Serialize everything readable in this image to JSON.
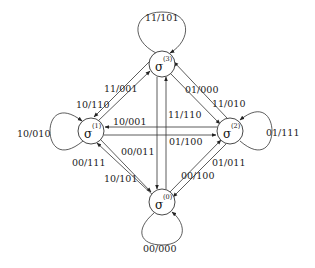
{
  "diagram": {
    "type": "state-transition-diagram",
    "states": [
      {
        "id": "s3",
        "symbol": "σ",
        "index": "(3)",
        "position": "top"
      },
      {
        "id": "s1",
        "symbol": "σ",
        "index": "(1)",
        "position": "left"
      },
      {
        "id": "s2",
        "symbol": "σ",
        "index": "(2)",
        "position": "right"
      },
      {
        "id": "s0",
        "symbol": "σ",
        "index": "(0)",
        "position": "bottom"
      }
    ],
    "self_loops": {
      "s3": "11/101",
      "s1": "10/010",
      "s2": "01/111",
      "s0": "00/000"
    },
    "transitions": {
      "s1_to_s3": "11/001",
      "s3_to_s1": "10/110",
      "s3_to_s2": "01/000",
      "s2_to_s3": "11/010",
      "s2_to_s1": "10/001",
      "s1_to_s2": "01/100",
      "s0_to_s3": "11/110",
      "s3_to_s0": "00/011",
      "s1_to_s0": "10/101",
      "s0_to_s1": "00/111",
      "s0_to_s2": "01/011",
      "s2_to_s0": "00/100"
    }
  }
}
